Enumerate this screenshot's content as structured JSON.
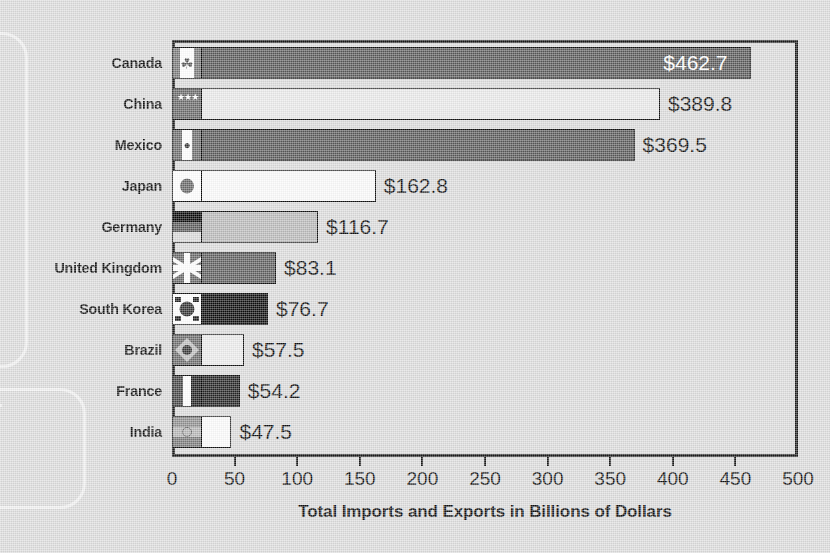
{
  "chart_data": {
    "type": "bar",
    "orientation": "horizontal",
    "title": "",
    "xlabel": "Total Imports and Exports in Billions of Dollars",
    "ylabel": "",
    "xlim": [
      0,
      500
    ],
    "xticks": [
      "0",
      "50",
      "100",
      "150",
      "200",
      "250",
      "300",
      "350",
      "400",
      "450",
      "500"
    ],
    "xtick_values": [
      0,
      50,
      100,
      150,
      200,
      250,
      300,
      350,
      400,
      450,
      500
    ],
    "grid": false,
    "legend": null,
    "categories": [
      "Canada",
      "China",
      "Mexico",
      "Japan",
      "Germany",
      "United Kingdom",
      "South Korea",
      "Brazil",
      "France",
      "India"
    ],
    "values": [
      462.7,
      389.8,
      369.5,
      162.8,
      116.7,
      83.1,
      76.7,
      57.5,
      54.2,
      47.5
    ],
    "value_labels": [
      "$462.7",
      "$389.8",
      "$369.5",
      "$162.8",
      "$116.7",
      "$83.1",
      "$76.7",
      "$57.5",
      "$54.2",
      "$47.5"
    ],
    "bars": [
      {
        "category": "Canada",
        "value": 462.7,
        "label": "$462.7",
        "color": "#595959",
        "label_inside": true,
        "flag": "flag-canada-icon",
        "flag_class": "f-canada",
        "glyph": "☘"
      },
      {
        "category": "China",
        "value": 389.8,
        "label": "$389.8",
        "color": "#e9e9e9",
        "label_inside": false,
        "flag": "flag-china-icon",
        "flag_class": "f-china",
        "glyph": "★★★"
      },
      {
        "category": "Mexico",
        "value": 369.5,
        "label": "$369.5",
        "color": "#5a5a5a",
        "label_inside": false,
        "flag": "flag-mexico-icon",
        "flag_class": "f-mexico",
        "glyph": "●"
      },
      {
        "category": "Japan",
        "value": 162.8,
        "label": "$162.8",
        "color": "#fbfbfb",
        "label_inside": false,
        "flag": "flag-japan-icon",
        "flag_class": "f-japan",
        "glyph": ""
      },
      {
        "category": "Germany",
        "value": 116.7,
        "label": "$116.7",
        "color": "#b9b9b9",
        "label_inside": false,
        "flag": "flag-germany-icon",
        "flag_class": "f-germany",
        "glyph": ""
      },
      {
        "category": "United Kingdom",
        "value": 83.1,
        "label": "$83.1",
        "color": "#5e5e5e",
        "label_inside": false,
        "flag": "flag-uk-icon",
        "flag_class": "f-uk",
        "glyph": ""
      },
      {
        "category": "South Korea",
        "value": 76.7,
        "label": "$76.7",
        "color": "#0d0d0d",
        "label_inside": false,
        "flag": "flag-korea-icon",
        "flag_class": "f-korea",
        "glyph": ""
      },
      {
        "category": "Brazil",
        "value": 57.5,
        "label": "$57.5",
        "color": "#ececec",
        "label_inside": false,
        "flag": "flag-brazil-icon",
        "flag_class": "f-brazil",
        "glyph": ""
      },
      {
        "category": "France",
        "value": 54.2,
        "label": "$54.2",
        "color": "#242424",
        "label_inside": false,
        "flag": "flag-france-icon",
        "flag_class": "f-france",
        "glyph": ""
      },
      {
        "category": "India",
        "value": 47.5,
        "label": "$47.5",
        "color": "#fcfcfc",
        "label_inside": false,
        "flag": "flag-india-icon",
        "flag_class": "f-india",
        "glyph": ""
      }
    ]
  },
  "colors": {
    "background": "#dcdcdc",
    "axis": "#1a1a1a",
    "text": "#111111",
    "decoration": "#f2f2f2",
    "inside_label_text": "#ffffff"
  }
}
